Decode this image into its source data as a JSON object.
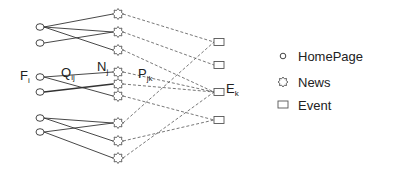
{
  "diagram": {
    "labels": {
      "F": {
        "main": "F",
        "sub": "i"
      },
      "Q": {
        "main": "Q",
        "sub": "ij"
      },
      "N": {
        "main": "N",
        "sub": "j"
      },
      "P": {
        "main": "P",
        "sub": "jk"
      },
      "E": {
        "main": "E",
        "sub": "k"
      }
    },
    "nodes": {
      "homepages": [
        {
          "id": "h1",
          "x": 40,
          "y": 27
        },
        {
          "id": "h2",
          "x": 40,
          "y": 43
        },
        {
          "id": "h3",
          "x": 40,
          "y": 77
        },
        {
          "id": "h4",
          "x": 40,
          "y": 92
        },
        {
          "id": "h5",
          "x": 40,
          "y": 118
        },
        {
          "id": "h6",
          "x": 40,
          "y": 132
        }
      ],
      "news": [
        {
          "id": "n1",
          "x": 118,
          "y": 14
        },
        {
          "id": "n2",
          "x": 118,
          "y": 32
        },
        {
          "id": "n3",
          "x": 118,
          "y": 50
        },
        {
          "id": "n4",
          "x": 118,
          "y": 72
        },
        {
          "id": "n5",
          "x": 118,
          "y": 84
        },
        {
          "id": "n6",
          "x": 118,
          "y": 96
        },
        {
          "id": "n7",
          "x": 118,
          "y": 123
        },
        {
          "id": "n8",
          "x": 118,
          "y": 141
        },
        {
          "id": "n9",
          "x": 118,
          "y": 158
        }
      ],
      "events": [
        {
          "id": "e1",
          "x": 219,
          "y": 42
        },
        {
          "id": "e2",
          "x": 219,
          "y": 65
        },
        {
          "id": "e3",
          "x": 219,
          "y": 92
        },
        {
          "id": "e4",
          "x": 219,
          "y": 120
        }
      ]
    },
    "solid_edges": [
      [
        "h1",
        "n1"
      ],
      [
        "h1",
        "n2"
      ],
      [
        "h1",
        "n3"
      ],
      [
        "h2",
        "n2"
      ],
      [
        "h3",
        "n4"
      ],
      [
        "h3",
        "n6"
      ],
      [
        "h4",
        "n5"
      ],
      [
        "h5",
        "n7"
      ],
      [
        "h5",
        "n8"
      ],
      [
        "h6",
        "n7"
      ],
      [
        "h6",
        "n9"
      ]
    ],
    "dashed_edges": [
      [
        "n1",
        "e1"
      ],
      [
        "n2",
        "e2"
      ],
      [
        "n3",
        "e3"
      ],
      [
        "n4",
        "e3"
      ],
      [
        "n5",
        "e3"
      ],
      [
        "n6",
        "e4"
      ],
      [
        "n7",
        "e1"
      ],
      [
        "n8",
        "e4"
      ],
      [
        "n9",
        "e3"
      ]
    ]
  },
  "legend": {
    "items": [
      {
        "icon": "circle",
        "label": "HomePage"
      },
      {
        "icon": "star",
        "label": "News"
      },
      {
        "icon": "square",
        "label": "Event"
      }
    ]
  }
}
